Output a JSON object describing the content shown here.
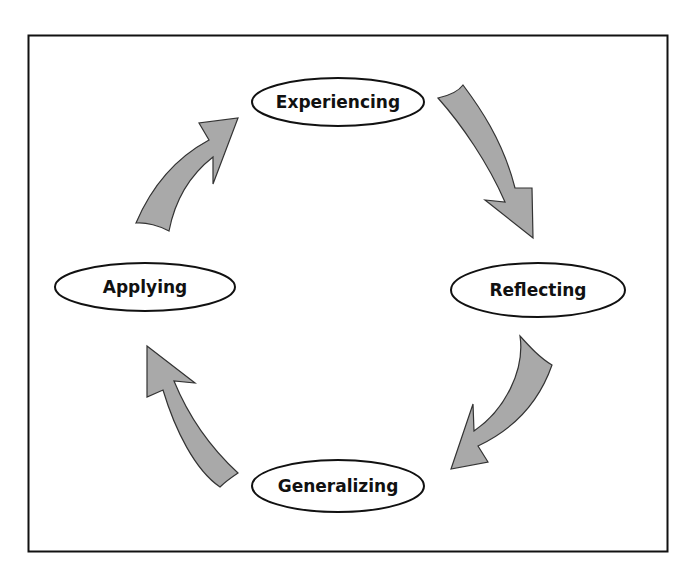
{
  "diagram": {
    "type": "cycle",
    "colors": {
      "background": "#ffffff",
      "frame_stroke": "#111111",
      "node_stroke": "#111111",
      "node_fill": "#ffffff",
      "arrow_fill": "#a9a9a9",
      "arrow_stroke": "#333333",
      "text": "#111111"
    },
    "nodes": [
      {
        "id": "experiencing",
        "label": "Experiencing"
      },
      {
        "id": "reflecting",
        "label": "Reflecting"
      },
      {
        "id": "generalizing",
        "label": "Generalizing"
      },
      {
        "id": "applying",
        "label": "Applying"
      }
    ],
    "edges": [
      {
        "from": "experiencing",
        "to": "reflecting"
      },
      {
        "from": "reflecting",
        "to": "generalizing"
      },
      {
        "from": "generalizing",
        "to": "applying"
      },
      {
        "from": "applying",
        "to": "experiencing"
      }
    ]
  }
}
